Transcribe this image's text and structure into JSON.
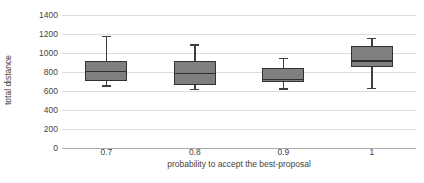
{
  "chart_data": {
    "type": "boxplot",
    "title": "",
    "xlabel": "probability to accept the best-proposal",
    "ylabel": "total distance",
    "categories": [
      "0.7",
      "0.8",
      "0.9",
      "1"
    ],
    "y_ticks": [
      0,
      200,
      400,
      600,
      800,
      1000,
      1200,
      1400
    ],
    "ylim": [
      0,
      1400
    ],
    "grid": "horizontal-only",
    "legend": "none",
    "series": [
      {
        "category": "0.7",
        "whisker_low": 660,
        "q1": 700,
        "median": 810,
        "q3": 915,
        "whisker_high": 1180
      },
      {
        "category": "0.8",
        "whisker_low": 620,
        "q1": 660,
        "median": 790,
        "q3": 910,
        "whisker_high": 1090
      },
      {
        "category": "0.9",
        "whisker_low": 630,
        "q1": 690,
        "median": 730,
        "q3": 845,
        "whisker_high": 950
      },
      {
        "category": "1",
        "whisker_low": 635,
        "q1": 855,
        "median": 925,
        "q3": 1070,
        "whisker_high": 1160
      }
    ],
    "colors": {
      "box_fill": "#7f7f7f",
      "box_border": "#333333",
      "gridline": "#dcdcdc",
      "axis_line": "#ababab",
      "axis_text": "#444444",
      "background": "#ffffff"
    }
  }
}
